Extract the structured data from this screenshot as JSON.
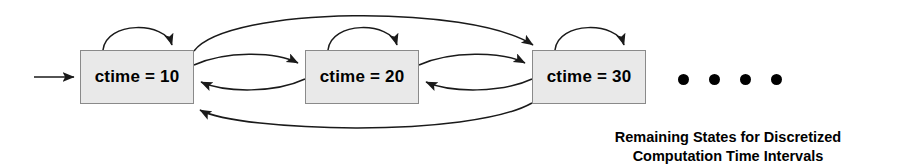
{
  "diagram": {
    "type": "state-transition-diagram",
    "background_color": "#ffffff",
    "line_color": "#1a1a1a",
    "states": [
      {
        "id": "s1",
        "label": "ctime = 10",
        "x": 80,
        "y": 50,
        "width": 114,
        "height": 54
      },
      {
        "id": "s2",
        "label": "ctime = 20",
        "x": 305,
        "y": 50,
        "width": 114,
        "height": 54
      },
      {
        "id": "s3",
        "label": "ctime = 30",
        "x": 532,
        "y": 50,
        "width": 114,
        "height": 54
      }
    ],
    "state_style": {
      "fill": "#e9e9e9",
      "border": "#8a8a8a"
    },
    "initial_arrow": {
      "from_x": 34,
      "to_x": 80,
      "y": 77
    },
    "self_loops": [
      {
        "on": "s1"
      },
      {
        "on": "s2"
      },
      {
        "on": "s3"
      }
    ],
    "transitions": [
      {
        "from": "s1",
        "to": "s2",
        "shape": "arc-up"
      },
      {
        "from": "s2",
        "to": "s1",
        "shape": "arc-down"
      },
      {
        "from": "s2",
        "to": "s3",
        "shape": "arc-up"
      },
      {
        "from": "s3",
        "to": "s2",
        "shape": "arc-down"
      },
      {
        "from": "s1",
        "to": "s3",
        "shape": "long-arc-over-top"
      },
      {
        "from": "s3",
        "to": "s1",
        "shape": "long-arc-under-bottom"
      }
    ],
    "ellipsis": {
      "dot_count": 4,
      "x": 678,
      "y": 74,
      "dot_size": 11
    },
    "caption": {
      "line1": "Remaining States for Discretized",
      "line2": "Computation Time Intervals",
      "x": 728,
      "y": 128
    }
  }
}
